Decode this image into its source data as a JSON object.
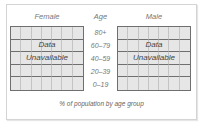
{
  "chart_data": {
    "type": "bar",
    "title": "",
    "caption": "% of population by age group",
    "xlabel": "% of population by age group",
    "ylabel": "Age",
    "categories": [
      "80+",
      "60–79",
      "40–59",
      "20–39",
      "0–19"
    ],
    "series": [
      {
        "name": "Female",
        "values": [
          null,
          null,
          null,
          null,
          null
        ],
        "status": "Data Unavailable"
      },
      {
        "name": "Male",
        "values": [
          null,
          null,
          null,
          null,
          null
        ],
        "status": "Data Unavailable"
      }
    ],
    "grid": true,
    "layout": "population pyramid"
  },
  "headers": {
    "female": "Female",
    "age": "Age",
    "male": "Male"
  },
  "age_groups": [
    "80+",
    "60–79",
    "40–59",
    "20–39",
    "0–19"
  ],
  "unavailable": {
    "line1": "Data",
    "line2": "Unavailable"
  },
  "caption": "% of population by age group",
  "colors": {
    "cell_fill": "#e6e6e6",
    "grid_major": "#6f6f6f",
    "grid_minor": "#c4c4c4",
    "label_text": "#777777"
  }
}
